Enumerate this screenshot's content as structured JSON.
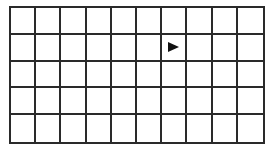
{
  "grid": {
    "rows": 5,
    "columns": 10,
    "line_color": "#2a2a2a",
    "background": "#ffffff"
  },
  "markers": [
    {
      "type": "arrow",
      "direction": "right",
      "row": 1,
      "column": 6,
      "icon": "arrow-right-icon",
      "color": "#111111"
    }
  ]
}
